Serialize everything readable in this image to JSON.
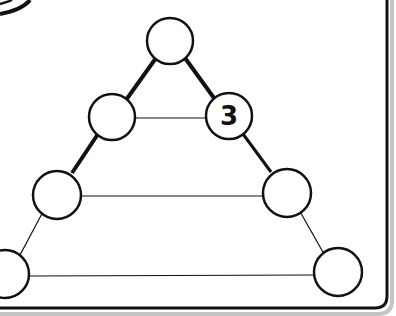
{
  "diagram": {
    "type": "number-pyramid",
    "rows": [
      {
        "row": 1,
        "nodes": [
          {
            "id": "top",
            "value": ""
          }
        ]
      },
      {
        "row": 2,
        "nodes": [
          {
            "id": "r2-left",
            "value": ""
          },
          {
            "id": "r2-right",
            "value": "3"
          }
        ]
      },
      {
        "row": 3,
        "nodes": [
          {
            "id": "r3-left",
            "value": ""
          },
          {
            "id": "r3-right",
            "value": ""
          }
        ]
      },
      {
        "row": 4,
        "nodes": [
          {
            "id": "r4-left",
            "value": ""
          },
          {
            "id": "r4-right",
            "value": ""
          }
        ]
      }
    ],
    "colors": {
      "stroke": "#111111",
      "background": "#ffffff",
      "frame_shadow": "#b9b9b9"
    }
  }
}
